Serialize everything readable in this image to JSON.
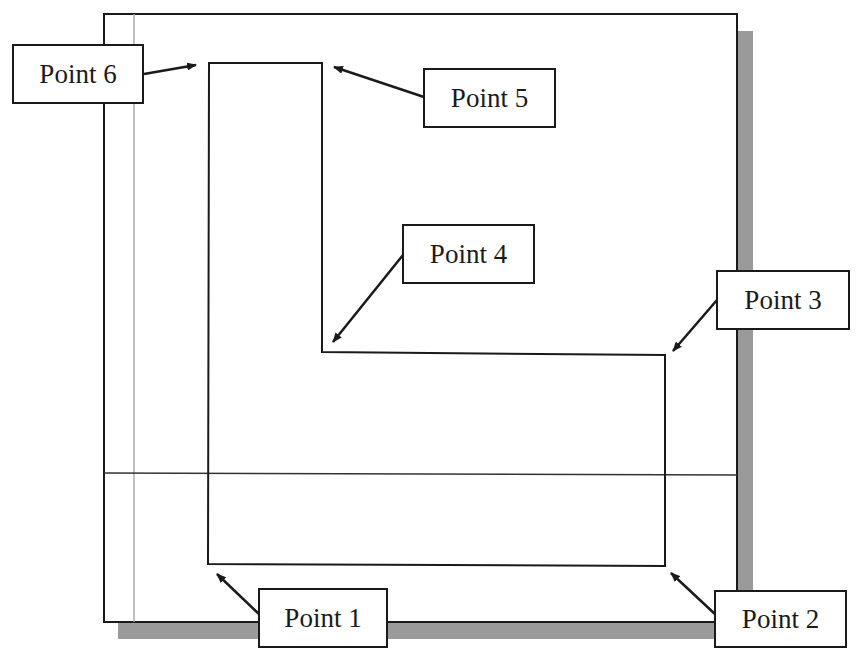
{
  "diagram": {
    "type": "sketch-outline",
    "colors": {
      "line": "#1a1a1a",
      "shadow": "#9a9a9a",
      "construction": "#aaaaaa",
      "background": "#ffffff"
    },
    "frame": {
      "x": 104,
      "y": 14,
      "width": 633,
      "height": 608
    },
    "points": [
      {
        "id": 1,
        "label": "Point 1",
        "vertex": [
          208,
          564
        ],
        "box": {
          "x": 258,
          "y": 588,
          "w": 130,
          "h": 60
        },
        "arrow_from": [
          260,
          615
        ],
        "arrow_to": [
          217,
          574
        ]
      },
      {
        "id": 2,
        "label": "Point 2",
        "vertex": [
          665,
          566
        ],
        "box": {
          "x": 714,
          "y": 590,
          "w": 133,
          "h": 58
        },
        "arrow_from": [
          716,
          615
        ],
        "arrow_to": [
          671,
          573
        ]
      },
      {
        "id": 3,
        "label": "Point 3",
        "vertex": [
          665,
          355
        ],
        "box": {
          "x": 716,
          "y": 270,
          "w": 134,
          "h": 60
        },
        "arrow_from": [
          717,
          300
        ],
        "arrow_to": [
          673,
          351
        ]
      },
      {
        "id": 4,
        "label": "Point 4",
        "vertex": [
          322,
          352
        ],
        "box": {
          "x": 402,
          "y": 224,
          "w": 133,
          "h": 60
        },
        "arrow_from": [
          403,
          255
        ],
        "arrow_to": [
          333,
          342
        ]
      },
      {
        "id": 5,
        "label": "Point 5",
        "vertex": [
          322,
          63
        ],
        "box": {
          "x": 423,
          "y": 68,
          "w": 133,
          "h": 60
        },
        "arrow_from": [
          424,
          97
        ],
        "arrow_to": [
          334,
          67
        ]
      },
      {
        "id": 6,
        "label": "Point 6",
        "vertex": [
          209,
          63
        ],
        "box": {
          "x": 12,
          "y": 44,
          "w": 132,
          "h": 60
        },
        "arrow_from": [
          144,
          74
        ],
        "arrow_to": [
          196,
          65
        ]
      }
    ]
  }
}
